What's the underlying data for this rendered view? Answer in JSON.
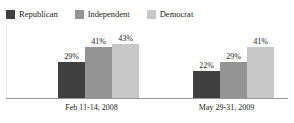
{
  "chart_data": {
    "type": "bar",
    "title": "",
    "subtitle": "",
    "xlabel": "",
    "ylabel": "",
    "ylim": [
      0,
      50
    ],
    "grid": false,
    "legend_position": "top-left",
    "value_suffix": "%",
    "categories": [
      "Feb 11-14, 2008",
      "May 29-31, 2009"
    ],
    "series": [
      {
        "name": "Republican",
        "color": "#3f3f3f",
        "values": [
          29,
          41
        ],
        "labels": [
          "29%",
          "41%"
        ]
      },
      {
        "name": "Independent",
        "color": "#949494",
        "values": [
          41,
          29
        ],
        "labels": [
          "41%",
          "29%"
        ]
      },
      {
        "name": "Democrat",
        "color": "#c8c8c8",
        "values": [
          43,
          41
        ],
        "labels": [
          "43%",
          "41%"
        ]
      }
    ]
  },
  "legend": {
    "entries": [
      {
        "label": "Republican",
        "color": "#3f3f3f"
      },
      {
        "label": "Independent",
        "color": "#949494"
      },
      {
        "label": "Democrat",
        "color": "#c8c8c8"
      }
    ]
  },
  "groups": [
    {
      "category": "Feb 11-14, 2008",
      "bars": [
        {
          "series": "Republican",
          "value": 29,
          "label": "29%",
          "color": "#3f3f3f"
        },
        {
          "series": "Independent",
          "value": 41,
          "label": "41%",
          "color": "#949494"
        },
        {
          "series": "Democrat",
          "value": 43,
          "label": "43%",
          "color": "#c8c8c8"
        }
      ]
    },
    {
      "category": "May 29-31, 2009",
      "bars": [
        {
          "series": "Republican",
          "value": 22,
          "label": "22%",
          "color": "#3f3f3f"
        },
        {
          "series": "Independent",
          "value": 29,
          "label": "29%",
          "color": "#949494"
        },
        {
          "series": "Democrat",
          "value": 41,
          "label": "41%",
          "color": "#c8c8c8"
        }
      ]
    }
  ],
  "axis": {
    "baseline_color": "#9a9a9a",
    "frame_color": "#e6e6e6"
  }
}
